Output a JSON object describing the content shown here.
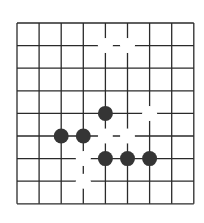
{
  "game": {
    "type": "go-board",
    "board": {
      "columns": 9,
      "rows": 9,
      "origin_x": 17,
      "origin_y": 23,
      "step_x": 22.1,
      "step_y": 22.6,
      "line_color": "#2a2a2a",
      "background": "#ffffff"
    },
    "colors": {
      "black": "#353535",
      "white": "#ffffff"
    },
    "stone_radius": 7.5,
    "stones": [
      {
        "color": "white",
        "col": 4,
        "row": 1
      },
      {
        "color": "white",
        "col": 5,
        "row": 1
      },
      {
        "color": "black",
        "col": 4,
        "row": 4
      },
      {
        "color": "white",
        "col": 6,
        "row": 4
      },
      {
        "color": "black",
        "col": 2,
        "row": 5
      },
      {
        "color": "black",
        "col": 3,
        "row": 5
      },
      {
        "color": "white",
        "col": 4,
        "row": 5
      },
      {
        "color": "white",
        "col": 5,
        "row": 5
      },
      {
        "color": "white",
        "col": 3,
        "row": 6
      },
      {
        "color": "black",
        "col": 4,
        "row": 6
      },
      {
        "color": "black",
        "col": 5,
        "row": 6
      },
      {
        "color": "black",
        "col": 6,
        "row": 6
      },
      {
        "color": "white",
        "col": 3,
        "row": 7
      }
    ]
  }
}
